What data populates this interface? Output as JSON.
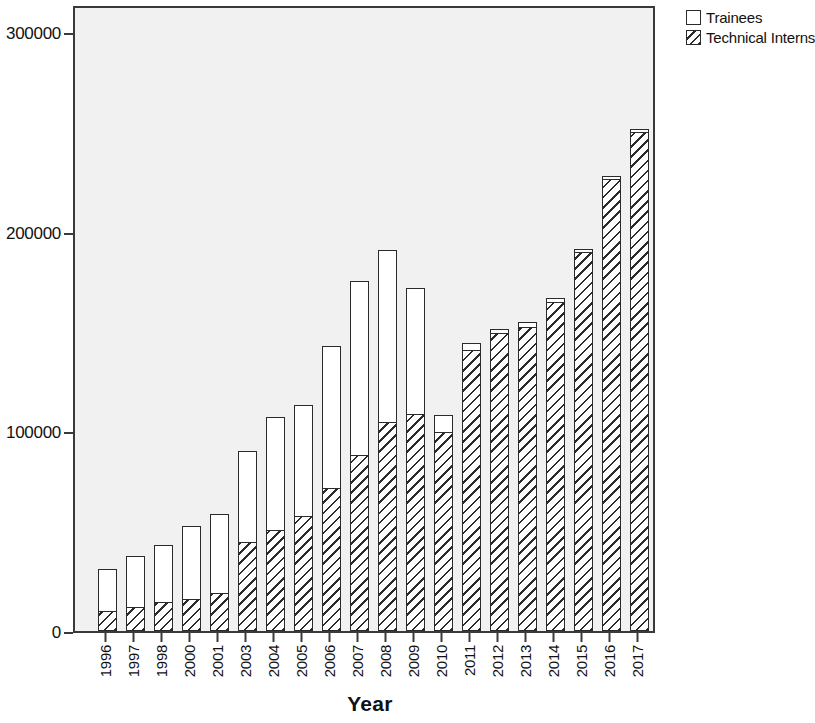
{
  "chart_data": {
    "type": "bar",
    "subtype": "stacked-bar",
    "title": "",
    "xlabel": "Year",
    "ylabel": "",
    "ylim": [
      0,
      300000
    ],
    "ytick_values": [
      0,
      100000,
      200000,
      300000
    ],
    "ytick_labels": [
      "0",
      "100000",
      "200000",
      "300000"
    ],
    "grid": false,
    "legend_position": "top-right",
    "categories": [
      "1996",
      "1997",
      "1998",
      "2000",
      "2001",
      "2003",
      "2004",
      "2005",
      "2006",
      "2007",
      "2008",
      "2009",
      "2010",
      "2011",
      "2012",
      "2013",
      "2014",
      "2015",
      "2016",
      "2017"
    ],
    "series": [
      {
        "name": "Technical Interns",
        "pattern": "diagonal-hatch",
        "values": [
          10500,
          12500,
          15000,
          16500,
          19500,
          45000,
          51000,
          58000,
          72000,
          88500,
          105000,
          109000,
          100000,
          141000,
          149500,
          152500,
          165000,
          190000,
          226500,
          250000
        ]
      },
      {
        "name": "Trainees",
        "pattern": "solid-white",
        "values": [
          20500,
          25000,
          28000,
          36000,
          39000,
          45000,
          56000,
          55000,
          71000,
          87000,
          86000,
          63000,
          8000,
          3500,
          2000,
          2500,
          2000,
          1500,
          1500,
          1500
        ]
      }
    ],
    "totals": [
      31000,
      37500,
      43000,
      52500,
      58500,
      90000,
      107000,
      113000,
      143000,
      175500,
      191000,
      172000,
      108000,
      144500,
      151500,
      155000,
      167000,
      191500,
      228000,
      251500
    ]
  },
  "legend": {
    "items": [
      {
        "label": "Trainees",
        "swatch": "empty-square-icon"
      },
      {
        "label": "Technical Interns",
        "swatch": "hatched-square-icon"
      }
    ]
  },
  "axes": {
    "x_title": "Year"
  }
}
